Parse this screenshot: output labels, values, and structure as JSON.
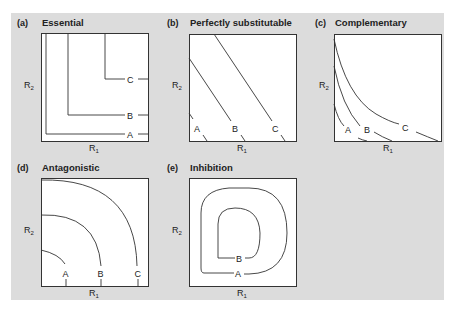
{
  "figure": {
    "background": "#dcdcdc",
    "line_color": "#333333"
  },
  "panels": [
    {
      "letter": "(a)",
      "title": "Essential",
      "xlabel": "R",
      "xsub": "1",
      "ylabel": "R",
      "ysub": "2",
      "curves": [
        "A",
        "B",
        "C"
      ]
    },
    {
      "letter": "(b)",
      "title": "Perfectly substitutable",
      "xlabel": "R",
      "xsub": "1",
      "ylabel": "R",
      "ysub": "2",
      "curves": [
        "A",
        "B",
        "C"
      ]
    },
    {
      "letter": "(c)",
      "title": "Complementary",
      "xlabel": "R",
      "xsub": "1",
      "ylabel": "R",
      "ysub": "2",
      "curves": [
        "A",
        "B",
        "C"
      ]
    },
    {
      "letter": "(d)",
      "title": "Antagonistic",
      "xlabel": "R",
      "xsub": "1",
      "ylabel": "R",
      "ysub": "2",
      "curves": [
        "A",
        "B",
        "C"
      ]
    },
    {
      "letter": "(e)",
      "title": "Inhibition",
      "xlabel": "R",
      "xsub": "1",
      "ylabel": "R",
      "ysub": "2",
      "curves": [
        "A",
        "B"
      ]
    }
  ]
}
